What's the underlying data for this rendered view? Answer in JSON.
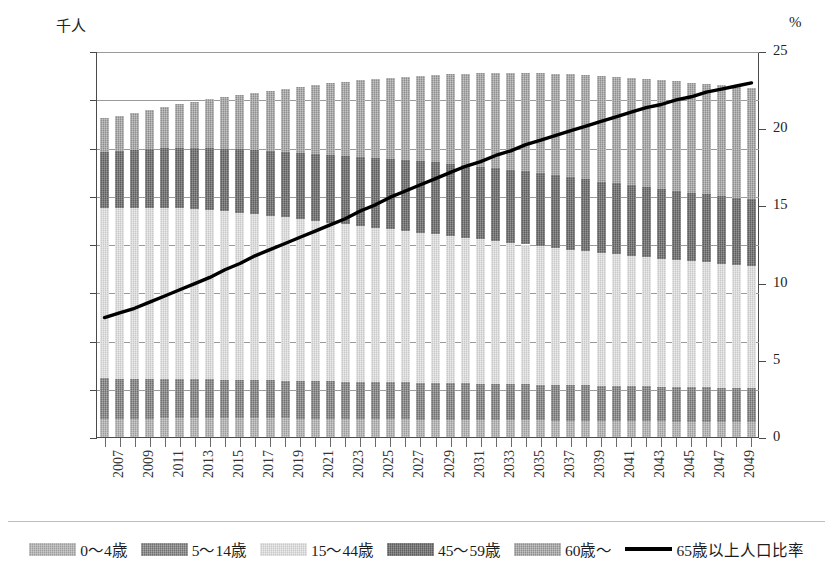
{
  "chart_data": {
    "type": "bar",
    "subtype": "stacked-bar-with-line",
    "title": "",
    "xlabel": "",
    "ylabel": "千人",
    "y2label": "%",
    "ylim": [
      0,
      1600000
    ],
    "y2lim": [
      0,
      25
    ],
    "grid": true,
    "legend_position": "bottom",
    "y_ticks": [
      "0",
      "200,000",
      "400,000",
      "600,000",
      "800,000",
      "1,000,000",
      "1,200,000",
      "1,400,000",
      "1,600,000"
    ],
    "y_tick_values": [
      0,
      200000,
      400000,
      600000,
      800000,
      1000000,
      1200000,
      1400000,
      1600000
    ],
    "y2_ticks": [
      "0",
      "5",
      "10",
      "15",
      "20",
      "25"
    ],
    "y2_tick_values": [
      0,
      5,
      10,
      15,
      20,
      25
    ],
    "categories": [
      2007,
      2008,
      2009,
      2010,
      2011,
      2012,
      2013,
      2014,
      2015,
      2016,
      2017,
      2018,
      2019,
      2020,
      2021,
      2022,
      2023,
      2024,
      2025,
      2026,
      2027,
      2028,
      2029,
      2030,
      2031,
      2032,
      2033,
      2034,
      2035,
      2036,
      2037,
      2038,
      2039,
      2040,
      2041,
      2042,
      2043,
      2044,
      2045,
      2046,
      2047,
      2048,
      2049,
      2050
    ],
    "tick_labels": [
      "2007",
      "2009",
      "2011",
      "2013",
      "2015",
      "2017",
      "2019",
      "2021",
      "2023",
      "2025",
      "2027",
      "2029",
      "2031",
      "2033",
      "2035",
      "2037",
      "2039",
      "2041",
      "2043",
      "2045",
      "2047",
      "2049"
    ],
    "series": [
      {
        "name": "0〜4歳",
        "color": "#9d9d9d",
        "values": [
          75000,
          75500,
          76000,
          76500,
          77000,
          77500,
          78000,
          78000,
          78000,
          78000,
          78000,
          77500,
          77000,
          76500,
          76000,
          75500,
          75000,
          74500,
          74000,
          73500,
          73000,
          72500,
          72000,
          71500,
          71000,
          70500,
          70000,
          69500,
          69000,
          68500,
          68000,
          67500,
          67000,
          66500,
          66000,
          65500,
          65000,
          64500,
          64000,
          63500,
          63000,
          62500,
          62000,
          61500
        ]
      },
      {
        "name": "5〜14歳",
        "color": "#6f6f6f",
        "values": [
          168000,
          167000,
          166000,
          165000,
          164000,
          163000,
          162000,
          161000,
          160000,
          159000,
          158000,
          157500,
          157000,
          156500,
          156000,
          155500,
          155000,
          154500,
          154000,
          153500,
          153000,
          152500,
          152000,
          151500,
          151000,
          150500,
          150000,
          149500,
          149000,
          148500,
          148000,
          147500,
          147000,
          146500,
          146000,
          145500,
          145000,
          144500,
          144000,
          143500,
          143000,
          142500,
          142000,
          141500
        ]
      },
      {
        "name": "15〜44歳",
        "color": "#c9c9c9",
        "values": [
          705000,
          706000,
          707000,
          708000,
          708000,
          707000,
          705000,
          702000,
          698000,
          693000,
          688000,
          682000,
          676000,
          670000,
          664000,
          658000,
          652000,
          646000,
          640000,
          634000,
          628000,
          622000,
          616000,
          610000,
          604000,
          598000,
          592000,
          586000,
          580000,
          574000,
          568000,
          562000,
          556000,
          550000,
          545000,
          540000,
          535000,
          530000,
          526000,
          522000,
          518000,
          514000,
          510000,
          506000
        ]
      },
      {
        "name": "45〜59歳",
        "color": "#5d5d5d",
        "values": [
          235000,
          238000,
          241000,
          244000,
          247000,
          250000,
          253000,
          256000,
          259000,
          262000,
          265000,
          268000,
          271000,
          274000,
          277000,
          280000,
          283000,
          286000,
          289000,
          292000,
          294000,
          296000,
          298000,
          300000,
          301000,
          302000,
          303000,
          303000,
          303000,
          302000,
          301000,
          300000,
          298000,
          296000,
          294000,
          292000,
          290000,
          288000,
          286000,
          284000,
          282000,
          280000,
          278000,
          276000
        ]
      },
      {
        "name": "60歳〜",
        "color": "#8e8e8e",
        "values": [
          138000,
          146000,
          154000,
          163000,
          172000,
          182000,
          192000,
          203000,
          214000,
          226000,
          238000,
          250000,
          262000,
          274000,
          286000,
          297000,
          308000,
          318000,
          328000,
          337000,
          346000,
          355000,
          363000,
          371000,
          379000,
          387000,
          394000,
          401000,
          408000,
          414000,
          420000,
          426000,
          431000,
          436000,
          440000,
          444000,
          448000,
          451000,
          454000,
          456000,
          458000,
          460000,
          461000,
          462000
        ]
      }
    ],
    "line_series": {
      "name": "65歳以上人口比率",
      "color": "#000000",
      "unit": "%",
      "axis": "secondary",
      "values": [
        7.8,
        8.1,
        8.4,
        8.8,
        9.2,
        9.6,
        10.0,
        10.4,
        10.9,
        11.3,
        11.8,
        12.2,
        12.6,
        13.0,
        13.4,
        13.8,
        14.2,
        14.7,
        15.1,
        15.6,
        16.0,
        16.4,
        16.8,
        17.2,
        17.6,
        17.9,
        18.3,
        18.6,
        19.0,
        19.3,
        19.6,
        19.9,
        20.2,
        20.5,
        20.8,
        21.1,
        21.4,
        21.6,
        21.9,
        22.1,
        22.4,
        22.6,
        22.8,
        23.0
      ]
    }
  },
  "legend": {
    "items": [
      {
        "label": "0〜4歳",
        "type": "swatch",
        "class": "c-a"
      },
      {
        "label": "5〜14歳",
        "type": "swatch",
        "class": "c-b"
      },
      {
        "label": "15〜44歳",
        "type": "swatch",
        "class": "c-c"
      },
      {
        "label": "45〜59歳",
        "type": "swatch",
        "class": "c-d"
      },
      {
        "label": "60歳〜",
        "type": "swatch",
        "class": "c-e"
      },
      {
        "label": "65歳以上人口比率",
        "type": "line",
        "class": "c-line"
      }
    ]
  }
}
